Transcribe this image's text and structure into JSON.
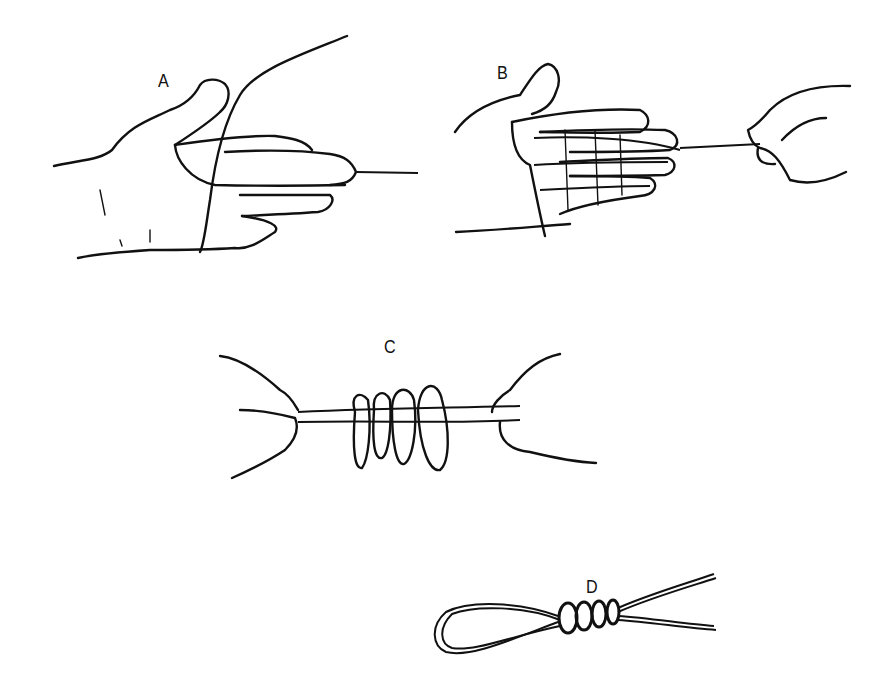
{
  "figure": {
    "panels": [
      {
        "id": "A",
        "label": "A",
        "depicts": "left hand with line draped across palm and over fingers"
      },
      {
        "id": "B",
        "label": "B",
        "depicts": "line wrapped around four fingers several times while right hand holds the end"
      },
      {
        "id": "C",
        "label": "C",
        "depicts": "both hands holding taut line with loops hanging from it"
      },
      {
        "id": "D",
        "label": "D",
        "depicts": "finished loop knot with coiled wraps"
      }
    ],
    "colors": {
      "ink": "#111111",
      "background": "#ffffff"
    }
  }
}
